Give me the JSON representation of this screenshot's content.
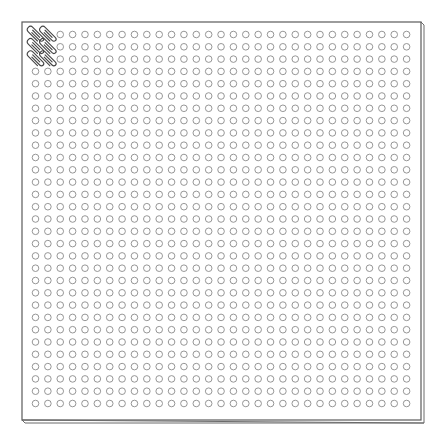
{
  "diagram": {
    "grid": {
      "rows": 31,
      "columns": 31,
      "cell_shape": "open-circle",
      "replaced_cells": {
        "region": "top-left",
        "rows": 3,
        "columns": 2,
        "replacement": "paper-clip-icon"
      }
    },
    "colors": {
      "frame": "#5a5a5a",
      "hole": "#8a8a8a",
      "clip": "#444444",
      "background": "#ffffff"
    }
  }
}
